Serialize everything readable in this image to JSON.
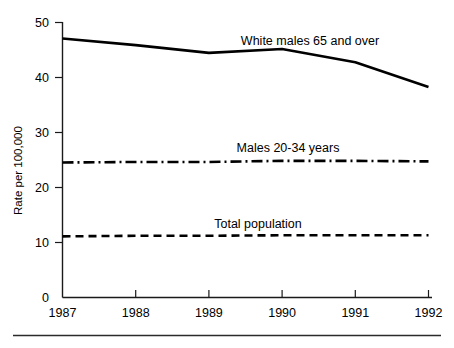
{
  "chart_data": {
    "type": "line",
    "title": "",
    "subtitle": "",
    "xlabel": "",
    "ylabel": "Rate per 100,000",
    "x": [
      1987,
      1988,
      1989,
      1990,
      1991,
      1992
    ],
    "xticklabels": [
      "1987",
      "1988",
      "1989",
      "1990",
      "1991",
      "1992"
    ],
    "yticks": [
      0,
      10,
      20,
      30,
      40,
      50
    ],
    "yticklabels": [
      "0",
      "10",
      "20",
      "30",
      "40",
      "50"
    ],
    "xlim": [
      1987,
      1992
    ],
    "ylim": [
      0,
      50
    ],
    "grid": false,
    "legend": "inline-annotations",
    "series": [
      {
        "name": "White males 65 and over",
        "style": "solid",
        "values": [
          47.0,
          45.8,
          44.4,
          45.1,
          42.7,
          38.2
        ]
      },
      {
        "name": "Males 20-34 years",
        "style": "dash-dot",
        "values": [
          24.5,
          24.6,
          24.6,
          24.8,
          24.8,
          24.7
        ]
      },
      {
        "name": "Total population",
        "style": "dashed",
        "values": [
          11.1,
          11.2,
          11.2,
          11.3,
          11.3,
          11.3
        ]
      }
    ],
    "annotations": [
      {
        "text": "White males 65 and over",
        "x": 310,
        "y": 45
      },
      {
        "text": "Males 20-34 years",
        "x": 288,
        "y": 152
      },
      {
        "text": "Total population",
        "x": 258,
        "y": 228
      }
    ],
    "colors": {
      "ink": "#000000",
      "axis": "#1a1a1a",
      "background": "#ffffff"
    }
  }
}
